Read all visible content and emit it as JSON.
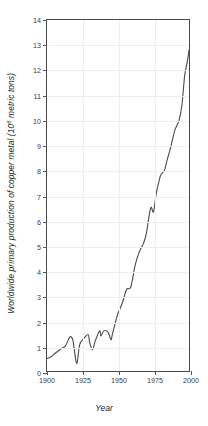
{
  "chart_data": {
    "type": "line",
    "title": "",
    "xlabel": "Year",
    "ylabel": "Worldwide primary production of copper metal (10⁶ metric tons)",
    "ylabel_prefix": "Worldwide primary production of copper metal (10",
    "ylabel_exponent": "6",
    "ylabel_suffix": " metric tons)",
    "xlim": [
      1900,
      2000
    ],
    "ylim": [
      0,
      14
    ],
    "xticks": [
      1900,
      1925,
      1950,
      1975,
      2000
    ],
    "xtick_labels": [
      "1900",
      "1925",
      "1950",
      "1975",
      "2000"
    ],
    "yticks": [
      0,
      1,
      2,
      3,
      4,
      5,
      6,
      7,
      8,
      9,
      10,
      11,
      12,
      13,
      14
    ],
    "ytick_labels": [
      "0",
      "1",
      "2",
      "3",
      "4",
      "5",
      "6",
      "7",
      "8",
      "9",
      "10",
      "11",
      "12",
      "13",
      "14"
    ],
    "grid": true,
    "legend": false,
    "line_color": "#4a4a4a",
    "axis_color": "#4a4a4a",
    "grid_color": "#eeeeee",
    "series": [
      {
        "name": "Worldwide primary copper production",
        "x": [
          1900,
          1903,
          1906,
          1910,
          1913,
          1916,
          1918,
          1919,
          1921,
          1923,
          1926,
          1929,
          1930,
          1932,
          1934,
          1937,
          1938,
          1940,
          1943,
          1945,
          1946,
          1948,
          1950,
          1953,
          1956,
          1959,
          1962,
          1965,
          1968,
          1970,
          1973,
          1975,
          1977,
          1979,
          1980,
          1982,
          1983,
          1985,
          1987,
          1990,
          1993,
          1995,
          1997,
          1999,
          2000
        ],
        "y": [
          0.5,
          0.58,
          0.72,
          0.89,
          1.0,
          1.35,
          1.28,
          0.95,
          0.3,
          1.05,
          1.3,
          1.45,
          1.15,
          0.85,
          1.2,
          1.6,
          1.4,
          1.6,
          1.55,
          1.25,
          1.45,
          1.9,
          2.3,
          2.7,
          3.25,
          3.35,
          4.2,
          4.75,
          5.1,
          5.5,
          6.5,
          6.35,
          7.1,
          7.6,
          7.8,
          7.95,
          8.05,
          8.5,
          8.9,
          9.6,
          10.0,
          10.6,
          11.8,
          12.4,
          12.8
        ]
      }
    ],
    "annotations": [
      {
        "label": "WWI post-war slump",
        "x": 1921,
        "y": 0.3
      },
      {
        "label": "Great Depression trough",
        "x": 1932,
        "y": 0.85
      }
    ]
  }
}
